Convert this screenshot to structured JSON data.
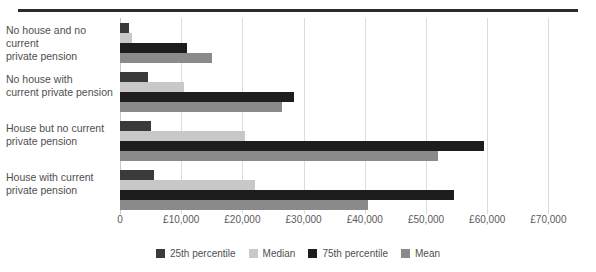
{
  "chart_data": {
    "type": "bar",
    "orientation": "horizontal",
    "title": "",
    "xlabel": "",
    "ylabel": "",
    "categories": [
      "No house and no current private pension",
      "No house with current private pension",
      "House but no current private pension",
      "House with current private pension"
    ],
    "series": [
      {
        "name": "25th percentile",
        "color": "#3a3a3a",
        "values": [
          1500,
          4500,
          5000,
          5500
        ]
      },
      {
        "name": "Median",
        "color": "#c8c8c8",
        "values": [
          2000,
          10500,
          20500,
          22000
        ]
      },
      {
        "name": "75th percentile",
        "color": "#1d1d1d",
        "values": [
          11000,
          28500,
          59500,
          54500
        ]
      },
      {
        "name": "Mean",
        "color": "#8a8a8a",
        "values": [
          15000,
          26500,
          52000,
          40500
        ]
      }
    ],
    "xlim": [
      0,
      75000
    ],
    "xticks": [
      0,
      10000,
      20000,
      30000,
      40000,
      50000,
      60000,
      70000
    ],
    "xticklabels": [
      "0",
      "£10,000",
      "£20,000",
      "£30,000",
      "£40,000",
      "£50,000",
      "£60,000",
      "£70,000"
    ],
    "grid": true,
    "legend_position": "bottom"
  },
  "legend": {
    "items": [
      {
        "label": "25th percentile",
        "color": "#3a3a3a"
      },
      {
        "label": "Median",
        "color": "#c8c8c8"
      },
      {
        "label": "75th percentile",
        "color": "#1d1d1d"
      },
      {
        "label": "Mean",
        "color": "#8a8a8a"
      }
    ]
  },
  "category_lines": [
    [
      "No house and no current",
      "private pension"
    ],
    [
      "No house with",
      "current private pension"
    ],
    [
      "House but no current",
      "private pension"
    ],
    [
      "House with current",
      "private pension"
    ]
  ]
}
